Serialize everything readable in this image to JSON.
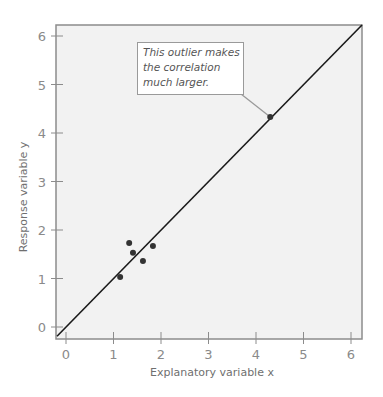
{
  "chart_data": {
    "type": "scatter",
    "title": "",
    "xlabel": "Explanatory variable x",
    "ylabel": "Response variable y",
    "xlim": [
      -0.2,
      6.2
    ],
    "ylim": [
      -0.2,
      6.2
    ],
    "xticks": [
      "0",
      "1",
      "2",
      "3",
      "4",
      "5",
      "6"
    ],
    "yticks": [
      "0",
      "1",
      "2",
      "3",
      "4",
      "5",
      "6"
    ],
    "grid": false,
    "legend": null,
    "series": [
      {
        "name": "points",
        "points": [
          {
            "x": 1.14,
            "y": 1.03
          },
          {
            "x": 1.33,
            "y": 1.73
          },
          {
            "x": 1.41,
            "y": 1.53
          },
          {
            "x": 1.62,
            "y": 1.36
          },
          {
            "x": 1.83,
            "y": 1.67
          },
          {
            "x": 4.3,
            "y": 4.33
          }
        ]
      }
    ],
    "reference_line": {
      "type": "y=x",
      "from": [
        -0.2,
        -0.2
      ],
      "to": [
        6.2,
        6.2
      ]
    },
    "annotations": [
      {
        "text": "This outlier makes the correlation much larger.",
        "lines": [
          "This outlier makes",
          "the correlation",
          "much larger."
        ],
        "target": {
          "x": 4.3,
          "y": 4.33
        }
      }
    ]
  },
  "colors": {
    "plot_background": "#f2f2f2",
    "frame": "#8c8c8c",
    "points": "#333333",
    "line": "#1a1a1a",
    "text": "#8a8a8a"
  }
}
